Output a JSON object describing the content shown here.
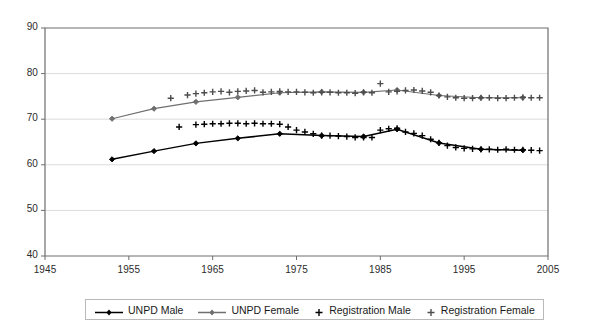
{
  "chart_data": {
    "type": "line",
    "title": "",
    "xlabel": "",
    "ylabel": "",
    "xlim": [
      1945,
      2005
    ],
    "ylim": [
      40,
      90
    ],
    "xticks": [
      1945,
      1955,
      1965,
      1975,
      1985,
      1995,
      2005
    ],
    "yticks": [
      40,
      50,
      60,
      70,
      80,
      90
    ],
    "grid": "horizontal",
    "legend_position": "bottom",
    "series": [
      {
        "name": "UNPD Male",
        "marker": "diamond",
        "line": "solid",
        "color": "#000000",
        "x": [
          1953,
          1958,
          1963,
          1968,
          1973,
          1978,
          1983,
          1987,
          1992,
          1997,
          2002
        ],
        "values": [
          61.2,
          63.0,
          64.7,
          65.8,
          66.8,
          66.4,
          66.2,
          67.8,
          64.8,
          63.4,
          63.2
        ]
      },
      {
        "name": "UNPD Female",
        "marker": "diamond",
        "line": "solid",
        "color": "#6f6f6f",
        "x": [
          1953,
          1958,
          1963,
          1968,
          1973,
          1978,
          1983,
          1987,
          1992,
          1997,
          2002
        ],
        "values": [
          70.1,
          72.3,
          73.8,
          74.8,
          75.8,
          76.0,
          75.9,
          76.4,
          75.2,
          74.7,
          74.7
        ]
      },
      {
        "name": "Registration Male",
        "marker": "plus",
        "line": "none",
        "color": "#000000",
        "x": [
          1961,
          1963,
          1964,
          1965,
          1966,
          1967,
          1968,
          1969,
          1970,
          1971,
          1972,
          1973,
          1974,
          1975,
          1976,
          1977,
          1978,
          1979,
          1980,
          1981,
          1982,
          1983,
          1984,
          1985,
          1986,
          1987,
          1988,
          1989,
          1990,
          1991,
          1992,
          1993,
          1994,
          1995,
          1996,
          1997,
          1998,
          1999,
          2000,
          2001,
          2002,
          2003,
          2004
        ],
        "values": [
          68.3,
          68.8,
          68.9,
          69.0,
          69.0,
          69.1,
          69.1,
          69.0,
          69.1,
          69.0,
          69.0,
          68.9,
          68.3,
          67.6,
          67.2,
          66.8,
          66.4,
          66.4,
          66.3,
          66.2,
          66.0,
          66.0,
          66.0,
          67.6,
          67.9,
          68.0,
          67.2,
          66.9,
          66.4,
          65.6,
          64.8,
          64.2,
          63.8,
          63.6,
          63.5,
          63.4,
          63.4,
          63.3,
          63.4,
          63.3,
          63.3,
          63.2,
          63.1
        ]
      },
      {
        "name": "Registration Female",
        "marker": "plus",
        "line": "none",
        "color": "#4d4d4d",
        "x": [
          1960,
          1962,
          1963,
          1964,
          1965,
          1966,
          1967,
          1968,
          1969,
          1970,
          1971,
          1972,
          1973,
          1974,
          1975,
          1976,
          1977,
          1978,
          1979,
          1980,
          1981,
          1982,
          1983,
          1984,
          1985,
          1986,
          1987,
          1988,
          1989,
          1990,
          1991,
          1992,
          1993,
          1994,
          1995,
          1996,
          1997,
          1998,
          1999,
          2000,
          2001,
          2002,
          2003,
          2004
        ],
        "values": [
          74.6,
          75.3,
          75.6,
          75.8,
          76.0,
          76.1,
          75.9,
          76.1,
          76.2,
          76.3,
          75.9,
          76.0,
          76.1,
          76.0,
          76.0,
          75.9,
          75.8,
          75.9,
          75.9,
          75.8,
          75.8,
          75.7,
          75.9,
          75.8,
          77.8,
          76.0,
          76.1,
          76.3,
          76.4,
          76.2,
          75.9,
          75.2,
          74.9,
          74.7,
          74.6,
          74.6,
          74.7,
          74.7,
          74.6,
          74.6,
          74.7,
          74.8,
          74.7,
          74.7
        ]
      }
    ]
  },
  "axes": {
    "y_tick_labels": [
      "90",
      "80",
      "70",
      "60",
      "50",
      "40"
    ],
    "x_tick_labels": [
      "1945",
      "1955",
      "1965",
      "1975",
      "1985",
      "1995",
      "2005"
    ]
  },
  "legend": {
    "items": [
      {
        "label": "UNPD Male",
        "key": "line-diamond",
        "color": "#000000"
      },
      {
        "label": "UNPD Female",
        "key": "line-diamond",
        "color": "#6f6f6f"
      },
      {
        "label": "Registration Male",
        "key": "plus",
        "color": "#000000"
      },
      {
        "label": "Registration Female",
        "key": "plus",
        "color": "#4d4d4d"
      }
    ]
  },
  "colors": {
    "plot_border": "#6e6e6e",
    "gridline": "#dcdcdc",
    "background": "#ffffff"
  }
}
